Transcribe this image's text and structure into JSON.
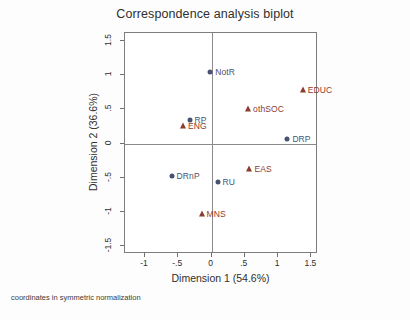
{
  "chart_data": {
    "type": "scatter",
    "title": "Correspondence analysis biplot",
    "xlabel": "Dimension 1 (54.6%)",
    "ylabel": "Dimension 2 (36.6%)",
    "footnote": "coordinates in symmetric normalization",
    "xlim": [
      -1.3,
      1.6
    ],
    "ylim": [
      -1.62,
      1.62
    ],
    "xticks": [
      "-1",
      "-.5",
      "0",
      ".5",
      "1",
      "1.5"
    ],
    "xtick_values": [
      -1,
      -0.5,
      0,
      0.5,
      1,
      1.5
    ],
    "yticks": [
      "1.5",
      "1",
      ".5",
      "0",
      "-.5",
      "-1",
      "-1.5"
    ],
    "ytick_values": [
      1.5,
      1,
      0.5,
      0,
      -0.5,
      -1,
      -1.5
    ],
    "grid": false,
    "legend": "none",
    "zero_lines": true,
    "colors": {
      "row_points": "#4a5171",
      "col_points": "#8c3b2e",
      "axis": "#7d7d7d",
      "zero_line": "#8a8a8a"
    },
    "series": [
      {
        "name": "row coordinates",
        "marker": "circle",
        "color": "#4a5171",
        "points": [
          {
            "label": "NotR",
            "x": -0.02,
            "y": 1.05
          },
          {
            "label": "RP",
            "x": -0.33,
            "y": 0.35
          },
          {
            "label": "DRP",
            "x": 1.14,
            "y": 0.06
          },
          {
            "label": "DRnP",
            "x": -0.6,
            "y": -0.47
          },
          {
            "label": "RU",
            "x": 0.09,
            "y": -0.57
          }
        ]
      },
      {
        "name": "column coordinates",
        "marker": "triangle",
        "color": "#8c3b2e",
        "points": [
          {
            "label": "EDUC",
            "x": 1.37,
            "y": 0.79
          },
          {
            "label": "othSOC",
            "x": 0.55,
            "y": 0.5
          },
          {
            "label": "ENG",
            "x": -0.43,
            "y": 0.26
          },
          {
            "label": "EAS",
            "x": 0.57,
            "y": -0.38
          },
          {
            "label": "MNS",
            "x": -0.15,
            "y": -1.04
          }
        ]
      }
    ]
  }
}
